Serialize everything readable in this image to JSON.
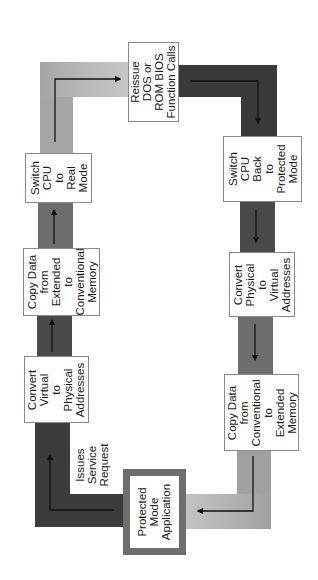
{
  "diagram": {
    "colors": {
      "dark_band": "#3f3f3f",
      "mid_band": "#6a6a6a",
      "light_band": "#a8a8a8",
      "lighter_band": "#bdbdbd",
      "app_border": "#6e6e6e",
      "arrow": "#111111"
    },
    "nodes": [
      {
        "id": "app",
        "lines": [
          "Protected",
          "Mode",
          "Application"
        ]
      },
      {
        "id": "virt2phys",
        "lines": [
          "Convert",
          "Virtual",
          "to",
          "Physical",
          "Addresses"
        ]
      },
      {
        "id": "copy_ext2conv",
        "lines": [
          "Copy  Data",
          "from",
          "Extended",
          "to",
          "Conventional",
          "Memory"
        ]
      },
      {
        "id": "switch_real",
        "lines": [
          "Switch",
          "CPU",
          "to",
          "Real",
          "Mode"
        ]
      },
      {
        "id": "reissue",
        "lines": [
          "Reissue",
          "DOS  or",
          "ROM  BIOS",
          "Function  Calls"
        ]
      },
      {
        "id": "switch_protected",
        "lines": [
          "Switch",
          "CPU",
          "Back",
          "to",
          "Protected",
          "Mode"
        ]
      },
      {
        "id": "phys2virt",
        "lines": [
          "Convert",
          "Physical",
          "to",
          "Virtual",
          "Addresses"
        ]
      },
      {
        "id": "copy_conv2ext",
        "lines": [
          "Copy  Data",
          "from",
          "Conventional",
          "to",
          "Extended",
          "Memory"
        ]
      }
    ],
    "edge_label": {
      "lines": [
        "Issues",
        "Service",
        "Request"
      ]
    },
    "edges": [
      [
        "app",
        "virt2phys"
      ],
      [
        "virt2phys",
        "copy_ext2conv"
      ],
      [
        "copy_ext2conv",
        "switch_real"
      ],
      [
        "switch_real",
        "reissue"
      ],
      [
        "reissue",
        "switch_protected"
      ],
      [
        "switch_protected",
        "phys2virt"
      ],
      [
        "phys2virt",
        "copy_conv2ext"
      ],
      [
        "copy_conv2ext",
        "app"
      ]
    ]
  }
}
